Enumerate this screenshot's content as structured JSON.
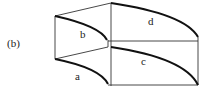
{
  "figure": {
    "panel_label": "(b)",
    "region_labels": {
      "a": "a",
      "b": "b",
      "c": "c",
      "d": "d"
    }
  }
}
